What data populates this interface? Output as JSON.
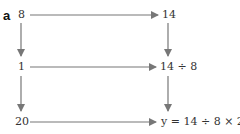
{
  "part_label": "a",
  "nodes": {
    "top_left": "8",
    "top_right": "14",
    "mid_left": "1",
    "mid_right": "14 ÷ 8",
    "bottom_left": "20",
    "bottom_right": "y = 14 ÷ 8 × 20"
  },
  "colors": {
    "arrow": "#777777",
    "text": "#333333"
  }
}
